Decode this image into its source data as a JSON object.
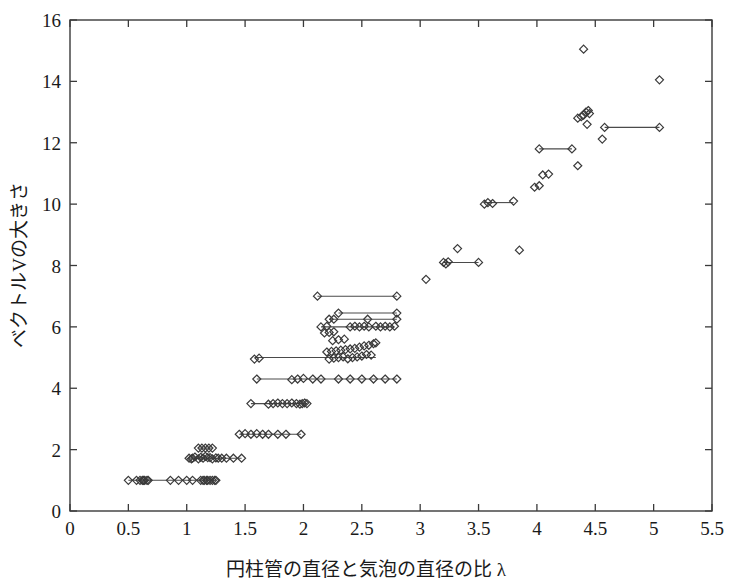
{
  "chart_data": {
    "type": "scatter",
    "title": "",
    "xlabel": "円柱管の直径と気泡の直径の比 λ",
    "ylabel": "ベクトルVの大きさ",
    "xlim": [
      0,
      5.5
    ],
    "ylim": [
      0,
      16
    ],
    "xticks": [
      0,
      0.5,
      1,
      1.5,
      2,
      2.5,
      3,
      3.5,
      4,
      4.5,
      5,
      5.5
    ],
    "xticklabels": [
      "0",
      "0.5",
      "1",
      "1.5",
      "2",
      "2.5",
      "3",
      "3.5",
      "4",
      "4.5",
      "5",
      "5.5"
    ],
    "yticks": [
      0,
      2,
      4,
      6,
      8,
      10,
      12,
      14,
      16
    ],
    "yticklabels": [
      "0",
      "2",
      "4",
      "6",
      "8",
      "10",
      "12",
      "14",
      "16"
    ],
    "grid": false,
    "legend": null,
    "marker": "open-diamond",
    "marker_color": "#3a3a3a",
    "line_color": "#4a4a4a",
    "points": [
      [
        0.5,
        1.0
      ],
      [
        0.57,
        1.0
      ],
      [
        0.6,
        1.0
      ],
      [
        0.62,
        1.0
      ],
      [
        0.63,
        1.0
      ],
      [
        0.64,
        1.0
      ],
      [
        0.66,
        1.0
      ],
      [
        0.67,
        1.0
      ],
      [
        0.86,
        1.0
      ],
      [
        0.93,
        1.0
      ],
      [
        1.0,
        1.0
      ],
      [
        1.05,
        1.0
      ],
      [
        1.12,
        1.0
      ],
      [
        1.14,
        1.0
      ],
      [
        1.15,
        1.0
      ],
      [
        1.17,
        1.0
      ],
      [
        1.18,
        1.0
      ],
      [
        1.2,
        1.0
      ],
      [
        1.22,
        1.0
      ],
      [
        1.24,
        1.0
      ],
      [
        1.25,
        1.0
      ],
      [
        1.1,
        1.7
      ],
      [
        1.12,
        1.75
      ],
      [
        1.14,
        1.72
      ],
      [
        1.16,
        1.78
      ],
      [
        1.18,
        1.74
      ],
      [
        1.05,
        1.72
      ],
      [
        1.07,
        1.76
      ],
      [
        1.02,
        1.72
      ],
      [
        1.04,
        1.7
      ],
      [
        1.2,
        1.74
      ],
      [
        1.22,
        1.7
      ],
      [
        1.25,
        1.73
      ],
      [
        1.27,
        1.72
      ],
      [
        1.3,
        1.72
      ],
      [
        1.34,
        1.72
      ],
      [
        1.4,
        1.72
      ],
      [
        1.47,
        1.72
      ],
      [
        1.1,
        2.05
      ],
      [
        1.13,
        2.05
      ],
      [
        1.16,
        2.05
      ],
      [
        1.19,
        2.05
      ],
      [
        1.22,
        2.05
      ],
      [
        1.45,
        2.5
      ],
      [
        1.5,
        2.52
      ],
      [
        1.55,
        2.5
      ],
      [
        1.6,
        2.52
      ],
      [
        1.65,
        2.5
      ],
      [
        1.7,
        2.5
      ],
      [
        1.78,
        2.5
      ],
      [
        1.85,
        2.5
      ],
      [
        1.98,
        2.5
      ],
      [
        1.55,
        3.5
      ],
      [
        1.7,
        3.48
      ],
      [
        1.74,
        3.5
      ],
      [
        1.78,
        3.52
      ],
      [
        1.82,
        3.5
      ],
      [
        1.86,
        3.5
      ],
      [
        1.9,
        3.52
      ],
      [
        1.94,
        3.5
      ],
      [
        1.97,
        3.48
      ],
      [
        1.99,
        3.5
      ],
      [
        2.01,
        3.52
      ],
      [
        2.03,
        3.5
      ],
      [
        1.6,
        4.3
      ],
      [
        1.9,
        4.28
      ],
      [
        1.95,
        4.3
      ],
      [
        2.0,
        4.32
      ],
      [
        2.08,
        4.3
      ],
      [
        2.15,
        4.3
      ],
      [
        2.3,
        4.3
      ],
      [
        2.4,
        4.3
      ],
      [
        2.5,
        4.3
      ],
      [
        2.6,
        4.3
      ],
      [
        2.7,
        4.3
      ],
      [
        2.8,
        4.3
      ],
      [
        1.58,
        4.95
      ],
      [
        1.62,
        4.98
      ],
      [
        2.22,
        4.95
      ],
      [
        2.26,
        4.98
      ],
      [
        2.3,
        5.0
      ],
      [
        2.34,
        5.02
      ],
      [
        2.38,
        4.96
      ],
      [
        2.42,
        5.0
      ],
      [
        2.46,
        5.02
      ],
      [
        2.5,
        5.05
      ],
      [
        2.54,
        5.1
      ],
      [
        2.58,
        5.08
      ],
      [
        2.2,
        5.18
      ],
      [
        2.24,
        5.2
      ],
      [
        2.28,
        5.22
      ],
      [
        2.32,
        5.24
      ],
      [
        2.36,
        5.26
      ],
      [
        2.4,
        5.28
      ],
      [
        2.44,
        5.3
      ],
      [
        2.48,
        5.34
      ],
      [
        2.52,
        5.38
      ],
      [
        2.56,
        5.4
      ],
      [
        2.6,
        5.45
      ],
      [
        2.62,
        5.48
      ],
      [
        2.25,
        5.55
      ],
      [
        2.3,
        5.58
      ],
      [
        2.35,
        5.6
      ],
      [
        2.18,
        5.8
      ],
      [
        2.22,
        5.82
      ],
      [
        2.26,
        5.84
      ],
      [
        2.15,
        6.0
      ],
      [
        2.2,
        6.02
      ],
      [
        2.4,
        6.0
      ],
      [
        2.44,
        6.02
      ],
      [
        2.48,
        6.0
      ],
      [
        2.52,
        6.02
      ],
      [
        2.56,
        6.0
      ],
      [
        2.62,
        6.02
      ],
      [
        2.66,
        6.0
      ],
      [
        2.7,
        6.02
      ],
      [
        2.74,
        6.0
      ],
      [
        2.78,
        6.02
      ],
      [
        2.22,
        6.25
      ],
      [
        2.26,
        6.25
      ],
      [
        2.55,
        6.25
      ],
      [
        2.8,
        6.25
      ],
      [
        2.3,
        6.45
      ],
      [
        2.8,
        6.45
      ],
      [
        2.12,
        7.0
      ],
      [
        2.8,
        7.0
      ],
      [
        3.05,
        7.55
      ],
      [
        3.2,
        8.1
      ],
      [
        3.22,
        8.05
      ],
      [
        3.24,
        8.12
      ],
      [
        3.5,
        8.1
      ],
      [
        3.32,
        8.55
      ],
      [
        3.85,
        8.5
      ],
      [
        3.55,
        10.0
      ],
      [
        3.58,
        10.05
      ],
      [
        3.62,
        10.02
      ],
      [
        3.8,
        10.1
      ],
      [
        3.98,
        10.55
      ],
      [
        4.02,
        10.6
      ],
      [
        4.05,
        10.95
      ],
      [
        4.1,
        10.98
      ],
      [
        4.02,
        11.8
      ],
      [
        4.3,
        11.8
      ],
      [
        4.35,
        11.25
      ],
      [
        4.35,
        12.8
      ],
      [
        4.38,
        12.85
      ],
      [
        4.4,
        12.9
      ],
      [
        4.42,
        13.0
      ],
      [
        4.44,
        13.05
      ],
      [
        4.45,
        12.95
      ],
      [
        4.43,
        12.6
      ],
      [
        4.58,
        12.5
      ],
      [
        5.05,
        12.5
      ],
      [
        4.56,
        12.12
      ],
      [
        4.4,
        15.05
      ],
      [
        5.05,
        14.05
      ]
    ],
    "connections": [
      [
        0.5,
        1.25,
        1.0
      ],
      [
        1.02,
        1.47,
        1.72
      ],
      [
        1.1,
        1.22,
        2.05
      ],
      [
        1.45,
        1.98,
        2.5
      ],
      [
        1.55,
        2.03,
        3.5
      ],
      [
        1.6,
        2.8,
        4.3
      ],
      [
        1.58,
        2.62,
        5.0
      ],
      [
        2.15,
        2.78,
        6.0
      ],
      [
        2.22,
        2.8,
        6.25
      ],
      [
        2.3,
        2.8,
        6.45
      ],
      [
        2.12,
        2.8,
        7.0
      ],
      [
        3.2,
        3.5,
        8.1
      ],
      [
        3.55,
        3.8,
        10.05
      ],
      [
        4.02,
        4.3,
        11.8
      ],
      [
        4.58,
        5.05,
        12.5
      ]
    ]
  }
}
